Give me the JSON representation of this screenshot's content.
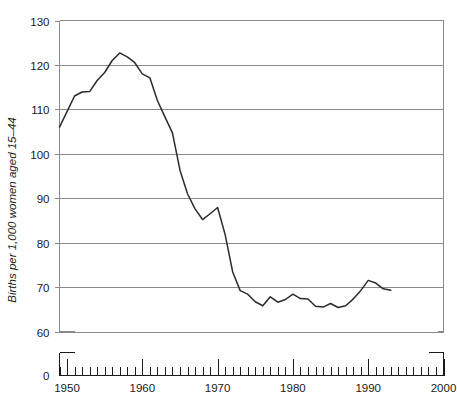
{
  "chart_data": {
    "type": "line",
    "title": "",
    "subtitle": "",
    "xlabel": "",
    "ylabel": "Births per 1,000 women aged 15–44",
    "xlim": [
      1949,
      2000
    ],
    "ylim": [
      60,
      130
    ],
    "y_axis_break": true,
    "y_break_from": 0,
    "y_break_to": 60,
    "grid": true,
    "grid_axis": "y",
    "legend": "none",
    "x_ticks_major": [
      1950,
      1960,
      1970,
      1980,
      1990,
      2000
    ],
    "x_tick_labels": [
      "1950",
      "1960",
      "1970",
      "1980",
      "1990",
      "2000"
    ],
    "x_ticks_minor_interval": 1,
    "y_ticks": [
      0,
      60,
      70,
      80,
      90,
      100,
      110,
      120,
      130
    ],
    "y_tick_labels": [
      "0",
      "60",
      "70",
      "80",
      "90",
      "100",
      "110",
      "120",
      "130"
    ],
    "series": [
      {
        "name": "General fertility rate",
        "color": "#2b2b2b",
        "x": [
          1949,
          1950,
          1951,
          1952,
          1953,
          1954,
          1955,
          1956,
          1957,
          1958,
          1959,
          1960,
          1961,
          1962,
          1963,
          1964,
          1965,
          1966,
          1967,
          1968,
          1969,
          1970,
          1971,
          1972,
          1973,
          1974,
          1975,
          1976,
          1977,
          1978,
          1979,
          1980,
          1981,
          1982,
          1983,
          1984,
          1985,
          1986,
          1987,
          1988,
          1989,
          1990,
          1991,
          1992,
          1993
        ],
        "values": [
          106.0,
          109.5,
          113.0,
          113.9,
          114.0,
          116.5,
          118.3,
          121.0,
          122.7,
          121.8,
          120.5,
          118.0,
          117.1,
          112.0,
          108.3,
          104.7,
          96.3,
          91.0,
          87.6,
          85.2,
          86.5,
          87.9,
          81.8,
          73.4,
          69.2,
          68.4,
          66.7,
          65.8,
          67.8,
          66.6,
          67.2,
          68.4,
          67.4,
          67.3,
          65.7,
          65.5,
          66.3,
          65.4,
          65.8,
          67.3,
          69.2,
          71.5,
          70.9,
          69.6,
          69.3
        ]
      }
    ],
    "annotations": []
  },
  "figure": {
    "axis_color": "#8a8a8a",
    "axis_text_color": "#1a1a1a",
    "background": "#ffffff"
  }
}
